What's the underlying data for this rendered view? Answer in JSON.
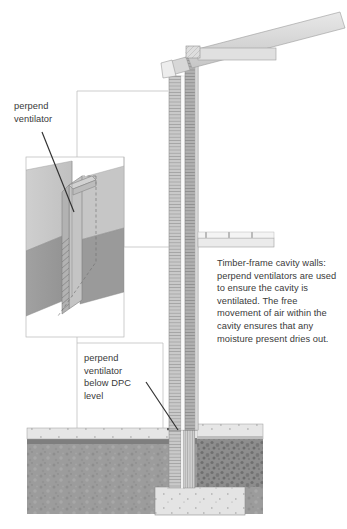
{
  "figure": {
    "background_color": "#ffffff",
    "text_color": "#3a3a3a",
    "labels": {
      "perpend_ventilator": "perpend\nventilator",
      "perpend_ventilator_below_dpc": "perpend\nventilator\nbelow DPC\nlevel"
    },
    "note": {
      "text": "Timber-frame cavity walls: perpend ventilators are used to ensure the cavity is ventilated. The free movement of air within the cavity ensures that any moisture present dries out."
    },
    "palette": {
      "line": "#6b6b6b",
      "callout_line": "#b4b4b4",
      "leader_line": "#2e2e2e",
      "brick_light": "#d2d2d2",
      "brick_mid": "#bdbdbd",
      "brick_dark": "#a0a0a0",
      "soil": "#9c9c9c",
      "soil_top": "#7e7e7e",
      "concrete": "#e2e2e2",
      "hardcore": "#8f8f8f",
      "timber": "#dcdcdc",
      "inset_upper": "#c8c8c8",
      "inset_lower": "#9a9a9a",
      "vent_body": "#c4c4c4"
    },
    "elements": [
      {
        "name": "roof-rafter",
        "kind": "sloping-timber"
      },
      {
        "name": "wall-plate",
        "kind": "timber-block"
      },
      {
        "name": "ceiling-joist",
        "kind": "horizontal-timber"
      },
      {
        "name": "fascia-soffit",
        "kind": "eaves-trim"
      },
      {
        "name": "outer-brick-leaf",
        "kind": "hatched-masonry"
      },
      {
        "name": "cavity",
        "kind": "air-gap"
      },
      {
        "name": "inner-timber-frame-leaf",
        "kind": "hatched-stud-wall"
      },
      {
        "name": "intermediate-floor-joist",
        "kind": "horizontal-timber"
      },
      {
        "name": "ground-floor-slab",
        "kind": "concrete"
      },
      {
        "name": "hardcore-fill",
        "kind": "speckled-fill"
      },
      {
        "name": "concrete-strip-footing",
        "kind": "concrete"
      },
      {
        "name": "subsoil",
        "kind": "mottled-ground"
      },
      {
        "name": "dpc-level",
        "kind": "damp-proof-course"
      },
      {
        "name": "inset-detail-isometric",
        "kind": "cutaway-detail"
      },
      {
        "name": "perpend-ventilator-unit",
        "kind": "ribbed-vent"
      }
    ]
  }
}
